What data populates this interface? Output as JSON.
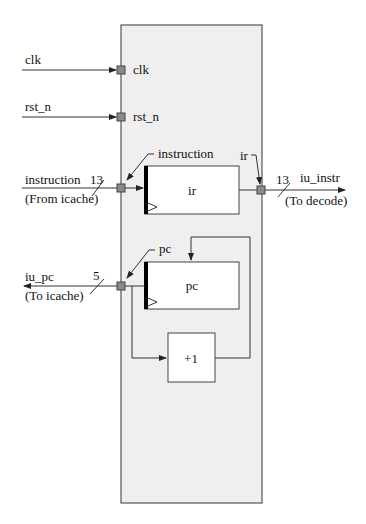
{
  "module": {
    "name": "iu_module",
    "fill": "#efefef",
    "border": "#555555"
  },
  "inputs": {
    "clk": {
      "label": "clk",
      "port_label": "clk"
    },
    "rst_n": {
      "label": "rst_n",
      "port_label": "rst_n"
    },
    "instruction": {
      "label": "instruction",
      "width": "13",
      "source": "(From icache)",
      "port_label": "instruction"
    }
  },
  "outputs": {
    "iu_instr": {
      "label": "iu_instr",
      "width": "13",
      "dest": "(To decode)",
      "port_label": "ir"
    },
    "iu_pc": {
      "label": "iu_pc",
      "width": "5",
      "dest": "(To icache)",
      "port_label": "pc"
    }
  },
  "blocks": {
    "ir": {
      "label": "ir",
      "type": "register"
    },
    "pc": {
      "label": "pc",
      "type": "register"
    },
    "inc": {
      "label": "+1",
      "type": "adder"
    }
  },
  "colors": {
    "wire": "#333333",
    "port": "#8a8a8a",
    "register_clock_bar": "#000000"
  }
}
